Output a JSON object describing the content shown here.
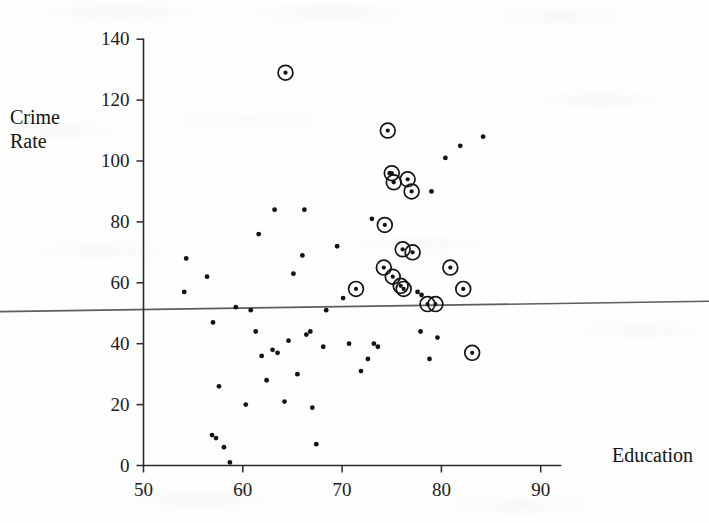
{
  "figure": {
    "title": "",
    "ylabel_line1": "Crime",
    "ylabel_line2": "Rate",
    "xlabel": "Education"
  },
  "axes": {
    "x_ticks": [
      "50",
      "60",
      "70",
      "80",
      "90"
    ],
    "y_ticks": [
      "0",
      "20",
      "40",
      "60",
      "80",
      "100",
      "120",
      "140"
    ]
  },
  "colors": {
    "axis": "#2b2b2b",
    "point": "#131313",
    "regression_line": "#5d5d62",
    "background": "#fefefe"
  },
  "chart_data": {
    "type": "scatter",
    "title": "",
    "xlabel": "Education",
    "ylabel": "Crime Rate",
    "xlim": [
      50,
      92
    ],
    "ylim": [
      0,
      140
    ],
    "xticks": [
      50,
      60,
      70,
      80,
      90
    ],
    "yticks": [
      0,
      20,
      40,
      60,
      80,
      100,
      120,
      140
    ],
    "grid": false,
    "legend": "none",
    "annotations": [
      "Circled markers denote highlighted (influential/selected) observations",
      "A nearly horizontal least-squares regression line is drawn across the full plot width"
    ],
    "regression_line": {
      "x_start": 45.0,
      "y_start": 51.0,
      "x_end": 92.5,
      "y_end": 53.3,
      "slope": 0.048,
      "intercept": 48.8
    },
    "series": [
      {
        "name": "Highlighted (circled) points",
        "marker": "circled-dot",
        "points": [
          {
            "x": 64.3,
            "y": 129
          },
          {
            "x": 74.6,
            "y": 110
          },
          {
            "x": 75.0,
            "y": 96
          },
          {
            "x": 75.2,
            "y": 93
          },
          {
            "x": 76.6,
            "y": 94
          },
          {
            "x": 77.0,
            "y": 90
          },
          {
            "x": 74.3,
            "y": 79
          },
          {
            "x": 76.1,
            "y": 71
          },
          {
            "x": 77.1,
            "y": 70
          },
          {
            "x": 74.2,
            "y": 65
          },
          {
            "x": 71.4,
            "y": 58
          },
          {
            "x": 75.1,
            "y": 62
          },
          {
            "x": 75.9,
            "y": 59
          },
          {
            "x": 76.2,
            "y": 58
          },
          {
            "x": 78.6,
            "y": 53
          },
          {
            "x": 79.4,
            "y": 53
          },
          {
            "x": 80.9,
            "y": 65
          },
          {
            "x": 82.2,
            "y": 58
          },
          {
            "x": 83.1,
            "y": 37
          }
        ]
      },
      {
        "name": "Ordinary points",
        "marker": "dot",
        "points": [
          {
            "x": 54.3,
            "y": 68
          },
          {
            "x": 54.1,
            "y": 57
          },
          {
            "x": 56.4,
            "y": 62
          },
          {
            "x": 57.0,
            "y": 47
          },
          {
            "x": 57.6,
            "y": 26
          },
          {
            "x": 56.9,
            "y": 10
          },
          {
            "x": 57.3,
            "y": 9
          },
          {
            "x": 58.1,
            "y": 6
          },
          {
            "x": 58.7,
            "y": 1
          },
          {
            "x": 59.3,
            "y": 52
          },
          {
            "x": 60.3,
            "y": 20
          },
          {
            "x": 60.8,
            "y": 51
          },
          {
            "x": 61.3,
            "y": 44
          },
          {
            "x": 61.6,
            "y": 76
          },
          {
            "x": 61.9,
            "y": 36
          },
          {
            "x": 62.4,
            "y": 28
          },
          {
            "x": 63.2,
            "y": 84
          },
          {
            "x": 63.0,
            "y": 38
          },
          {
            "x": 63.5,
            "y": 37
          },
          {
            "x": 64.2,
            "y": 21
          },
          {
            "x": 64.6,
            "y": 41
          },
          {
            "x": 65.1,
            "y": 63
          },
          {
            "x": 65.5,
            "y": 30
          },
          {
            "x": 66.2,
            "y": 84
          },
          {
            "x": 66.0,
            "y": 69
          },
          {
            "x": 66.4,
            "y": 43
          },
          {
            "x": 66.8,
            "y": 44
          },
          {
            "x": 67.0,
            "y": 19
          },
          {
            "x": 67.4,
            "y": 7
          },
          {
            "x": 68.1,
            "y": 39
          },
          {
            "x": 68.4,
            "y": 51
          },
          {
            "x": 69.5,
            "y": 72
          },
          {
            "x": 70.1,
            "y": 55
          },
          {
            "x": 70.7,
            "y": 40
          },
          {
            "x": 71.9,
            "y": 31
          },
          {
            "x": 72.6,
            "y": 35
          },
          {
            "x": 73.2,
            "y": 40
          },
          {
            "x": 73.6,
            "y": 39
          },
          {
            "x": 73.0,
            "y": 81
          },
          {
            "x": 74.8,
            "y": 96
          },
          {
            "x": 77.6,
            "y": 57
          },
          {
            "x": 78.0,
            "y": 56
          },
          {
            "x": 77.9,
            "y": 44
          },
          {
            "x": 78.8,
            "y": 35
          },
          {
            "x": 79.6,
            "y": 42
          },
          {
            "x": 79.0,
            "y": 90
          },
          {
            "x": 80.4,
            "y": 101
          },
          {
            "x": 81.9,
            "y": 105
          },
          {
            "x": 84.2,
            "y": 108
          }
        ]
      }
    ]
  }
}
